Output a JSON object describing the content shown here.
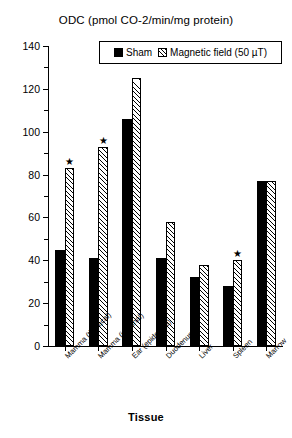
{
  "chart_data": {
    "type": "bar",
    "title": "ODC (pmol CO-2/min/mg protein)",
    "xlabel": "Tissue",
    "ylabel": "",
    "ylim": [
      0,
      140
    ],
    "ytick_step": 20,
    "grid": false,
    "legend_position": "top-center",
    "categories": [
      "Mamma (thoracal)",
      "Mamma (inguinal)",
      "Ear (epidermis)",
      "Duodenum",
      "Liver",
      "Spleen",
      "Marrow"
    ],
    "series": [
      {
        "name": "Sham",
        "values": [
          45,
          41,
          106,
          41,
          32,
          28,
          77
        ]
      },
      {
        "name": "Magnetic field (50 µT)",
        "values": [
          83,
          93,
          125,
          58,
          38,
          40,
          77
        ]
      }
    ],
    "annotations": [
      {
        "category": "Mamma (thoracal)",
        "symbol": "★",
        "on_series": "Magnetic field (50 µT)"
      },
      {
        "category": "Mamma (inguinal)",
        "symbol": "★",
        "on_series": "Magnetic field (50 µT)"
      },
      {
        "category": "Spleen",
        "symbol": "★",
        "on_series": "Magnetic field (50 µT)"
      }
    ],
    "ytick_labels": [
      "0",
      "20",
      "40",
      "60",
      "80",
      "100",
      "120",
      "140"
    ]
  },
  "legend": {
    "entries": [
      {
        "label": "Sham",
        "style": "solid-black"
      },
      {
        "label": "Magnetic field (50 µT)",
        "style": "diagonal-hatch"
      }
    ]
  }
}
